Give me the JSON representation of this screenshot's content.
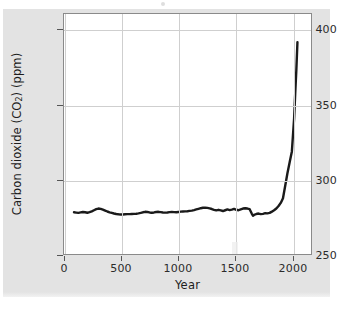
{
  "figure": {
    "background_color": "#e3e3e3",
    "plot_background_color": "#ffffff",
    "line_color": "#1a1a1a",
    "grid_color": "#cfcfcf",
    "axis_color": "#8a8a8a"
  },
  "chart_data": {
    "type": "line",
    "title": "",
    "xlabel": "Year",
    "ylabel": "Carbon dioxide (CO2) (ppm)",
    "ylabel_prefix": "Carbon dioxide (CO",
    "ylabel_sub": "2",
    "ylabel_suffix": ") (ppm)",
    "xlim": [
      -90,
      2150
    ],
    "ylim": [
      250,
      405
    ],
    "grid": true,
    "legend": null,
    "xticks": [
      0,
      500,
      1000,
      1500,
      2000
    ],
    "xtick_labels": [
      "0",
      "500",
      "1000",
      "1500",
      "2000"
    ],
    "yticks": [
      250,
      300,
      350,
      400
    ],
    "ytick_labels": [
      "250",
      "300",
      "350",
      "400"
    ],
    "series": [
      {
        "name": "Atmospheric CO2",
        "x": [
          0,
          20,
          40,
          60,
          80,
          100,
          120,
          140,
          160,
          180,
          200,
          220,
          240,
          260,
          280,
          300,
          320,
          340,
          360,
          380,
          400,
          420,
          440,
          460,
          480,
          500,
          520,
          540,
          560,
          580,
          600,
          620,
          640,
          660,
          680,
          700,
          720,
          740,
          760,
          780,
          800,
          820,
          840,
          860,
          880,
          900,
          920,
          940,
          960,
          980,
          1000,
          1020,
          1040,
          1060,
          1080,
          1100,
          1120,
          1140,
          1160,
          1180,
          1200,
          1220,
          1240,
          1260,
          1280,
          1300,
          1320,
          1340,
          1360,
          1380,
          1400,
          1420,
          1440,
          1460,
          1480,
          1500,
          1520,
          1540,
          1560,
          1580,
          1600,
          1610,
          1620,
          1640,
          1660,
          1680,
          1700,
          1720,
          1740,
          1760,
          1780,
          1800,
          1820,
          1840,
          1860,
          1880,
          1900,
          1920,
          1940,
          1960,
          1980,
          1990,
          2000,
          2010
        ],
        "y": [
          278.0,
          277.8,
          277.6,
          277.9,
          278.2,
          278.0,
          277.7,
          278.1,
          278.6,
          279.3,
          280.0,
          280.4,
          280.2,
          279.7,
          279.1,
          278.5,
          278.0,
          277.6,
          277.2,
          276.9,
          276.7,
          276.6,
          276.6,
          276.7,
          276.8,
          276.8,
          276.9,
          277.0,
          277.1,
          277.3,
          277.6,
          278.0,
          278.3,
          278.2,
          277.9,
          277.7,
          277.9,
          278.2,
          278.3,
          278.1,
          277.9,
          277.8,
          277.9,
          278.1,
          278.2,
          278.1,
          278.0,
          278.2,
          278.4,
          278.5,
          278.6,
          278.7,
          278.9,
          279.1,
          279.4,
          279.8,
          280.2,
          280.6,
          280.9,
          281.0,
          280.8,
          280.5,
          280.1,
          279.6,
          279.2,
          279.6,
          279.2,
          278.8,
          279.3,
          279.8,
          279.4,
          279.7,
          280.2,
          279.6,
          279.3,
          279.9,
          280.4,
          280.6,
          280.4,
          280.0,
          277.0,
          275.8,
          276.3,
          276.9,
          277.2,
          276.8,
          277.0,
          277.4,
          277.3,
          277.6,
          278.4,
          279.3,
          280.4,
          282.0,
          284.0,
          287.0,
          295.0,
          303.0,
          310.0,
          317.0,
          338.0,
          354.0,
          369.0,
          387.0
        ]
      }
    ],
    "annotations": []
  },
  "axes": {
    "ytick_positions_px": [
      255,
      180,
      105,
      29
    ],
    "xtick_positions_px": [
      64,
      121,
      178,
      235,
      293
    ]
  }
}
